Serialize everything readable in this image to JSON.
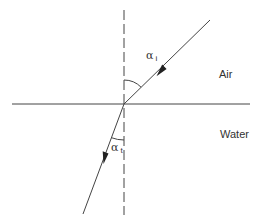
{
  "diagram": {
    "type": "refraction-at-interface",
    "media": {
      "upper": {
        "label": "Air"
      },
      "lower": {
        "label": "Water"
      }
    },
    "angles": {
      "incidence": {
        "symbol": "α",
        "subscript": "i"
      },
      "transmission": {
        "symbol": "α",
        "subscript": "t"
      }
    },
    "colors": {
      "line": "#444444",
      "text": "#333333",
      "background": "#ffffff"
    },
    "geometry": {
      "interface": {
        "x1": 12,
        "y1": 104,
        "x2": 250,
        "y2": 104
      },
      "normal": {
        "x": 124,
        "y_top": 10,
        "y_bottom": 215
      },
      "incident_ray": {
        "x1": 210,
        "y1": 20,
        "x2": 124,
        "y2": 104
      },
      "refracted_ray": {
        "x1": 124,
        "y1": 104,
        "x2": 83,
        "y2": 214
      }
    }
  }
}
